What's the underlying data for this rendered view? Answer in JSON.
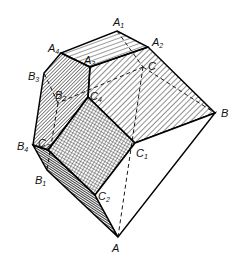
{
  "figure": {
    "labels": [
      {
        "id": "A1",
        "base": "A",
        "sub": "1",
        "x": 113,
        "y": 26
      },
      {
        "id": "A2",
        "base": "A",
        "sub": "2",
        "x": 152,
        "y": 46
      },
      {
        "id": "A3",
        "base": "A",
        "sub": "3",
        "x": 84,
        "y": 64
      },
      {
        "id": "A4",
        "base": "A",
        "sub": "4",
        "x": 48,
        "y": 52
      },
      {
        "id": "C",
        "base": "C",
        "sub": "",
        "x": 148,
        "y": 70
      },
      {
        "id": "B",
        "base": "B",
        "sub": "",
        "x": 221,
        "y": 117
      },
      {
        "id": "B3",
        "base": "B",
        "sub": "3",
        "x": 28,
        "y": 80
      },
      {
        "id": "B2",
        "base": "B",
        "sub": "2",
        "x": 55,
        "y": 99
      },
      {
        "id": "C4",
        "base": "C",
        "sub": "4",
        "x": 90,
        "y": 100
      },
      {
        "id": "B4",
        "base": "B",
        "sub": "4",
        "x": 17,
        "y": 150
      },
      {
        "id": "C3",
        "base": "C",
        "sub": "3",
        "x": 38,
        "y": 147
      },
      {
        "id": "C1",
        "base": "C",
        "sub": "1",
        "x": 136,
        "y": 157
      },
      {
        "id": "B1",
        "base": "B",
        "sub": "1",
        "x": 35,
        "y": 184
      },
      {
        "id": "C2",
        "base": "C",
        "sub": "2",
        "x": 98,
        "y": 200
      },
      {
        "id": "A",
        "base": "A",
        "sub": "",
        "x": 112,
        "y": 252
      }
    ]
  }
}
